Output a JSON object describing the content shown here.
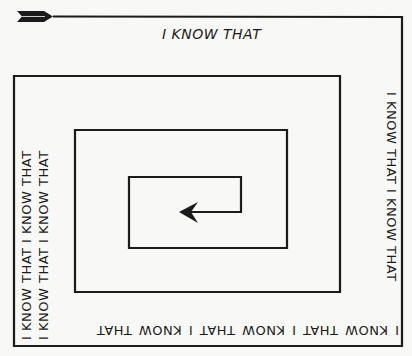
{
  "figure": {
    "phrase": "I KNOW THAT",
    "top_label": "I KNOW THAT",
    "right_label": "I KNOW THAT   I KNOW THAT",
    "bottom_label": "I KNOW THAT   I KNOW THAT   I KNOW THAT",
    "left_label_outer": "I KNOW THAT   I KNOW THAT",
    "left_label_inner": "I KNOW THAT   I KNOW THAT",
    "colors": {
      "line": "#1b1b1b",
      "background": "#f8f8f6"
    },
    "icons": {
      "start": "arrow-fletching-icon",
      "end": "arrowhead-left-icon"
    }
  }
}
